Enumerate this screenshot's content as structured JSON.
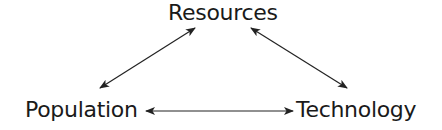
{
  "diagram": {
    "type": "triangle-relationship",
    "nodes": [
      {
        "id": "resources",
        "label": "Resources",
        "position": "top"
      },
      {
        "id": "population",
        "label": "Population",
        "position": "bottom-left"
      },
      {
        "id": "technology",
        "label": "Technology",
        "position": "bottom-right"
      }
    ],
    "edges": [
      {
        "from": "resources",
        "to": "population",
        "direction": "bidirectional"
      },
      {
        "from": "resources",
        "to": "technology",
        "direction": "bidirectional"
      },
      {
        "from": "population",
        "to": "technology",
        "direction": "bidirectional"
      }
    ],
    "colors": {
      "text": "#1a1a1a",
      "arrow": "#222222",
      "background": "#ffffff"
    }
  }
}
